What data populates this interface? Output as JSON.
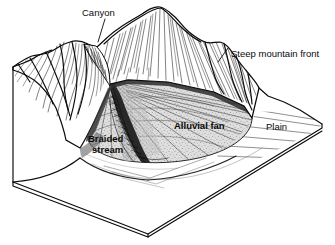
{
  "figure": {
    "kind": "block-diagram",
    "background_color": "#ffffff",
    "ink_color": "#0a0a0a"
  },
  "labels": {
    "canyon": "Canyon",
    "steep_mountain_front": "Steep mountain front",
    "alluvial_fan": "Alluvial fan",
    "braided_stream_line1": "Braided",
    "braided_stream_line2": "stream",
    "plain": "Plain"
  },
  "label_styles": {
    "canyon": "regular",
    "steep_mountain_front": "regular",
    "alluvial_fan": "bold",
    "braided_stream": "bold",
    "plain": "regular"
  },
  "features": {
    "mountain_mass": "eroded mountain range with ridges and gullies",
    "canyon_notch": "v-shaped canyon cutting the mountain front",
    "fan_apex": "fan head at canyon mouth",
    "fan_toe": "rounded distal margin of fan",
    "block_faces": [
      "left-front face",
      "right-front face",
      "top surface"
    ]
  },
  "shading": {
    "fan_fill": "#d8d8d8",
    "fan_stipple": "#6a6a6a",
    "plain_fill": "#ffffff",
    "shadow_fill": "#9a9a9a",
    "dark_channel": "#1c1c1c"
  }
}
